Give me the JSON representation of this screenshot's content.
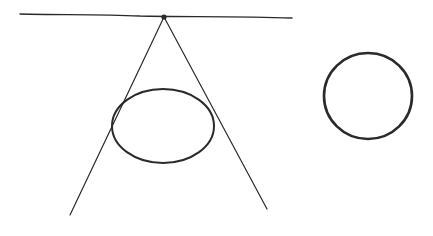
{
  "diagram": {
    "title": "",
    "stroke_color": "#2a2a2a",
    "background_color": "#ffffff",
    "elements": [
      {
        "name": "horizontal-line",
        "kind": "line"
      },
      {
        "name": "apex-point",
        "kind": "point"
      },
      {
        "name": "left-tangent-line",
        "kind": "line"
      },
      {
        "name": "right-tangent-line",
        "kind": "line"
      },
      {
        "name": "ellipse",
        "kind": "ellipse"
      },
      {
        "name": "circle",
        "kind": "circle"
      }
    ]
  }
}
